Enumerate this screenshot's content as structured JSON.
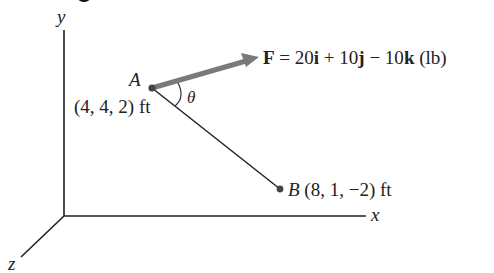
{
  "diagram": {
    "axes": {
      "x_label": "x",
      "y_label": "y",
      "z_label": "z"
    },
    "point_a": {
      "name": "A",
      "coords": "(4, 4, 2) ft"
    },
    "point_b": {
      "name": "B",
      "coords": "(8, 1, −2) ft"
    },
    "angle_label": "θ",
    "force": {
      "symbol": "F",
      "eq": " = 20",
      "i": "i",
      "plus": " + 10",
      "j": "j",
      "minus": " − 10",
      "k": "k",
      "unit": " (lb)"
    },
    "colors": {
      "force_arrow": "#7a7a7a",
      "lines": "#222222"
    }
  }
}
